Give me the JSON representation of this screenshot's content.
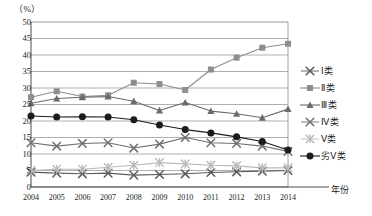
{
  "chart_data": {
    "type": "line",
    "title": "",
    "unit_label": "（%）",
    "xlabel": "年份",
    "ylabel": "",
    "grid": true,
    "legend_position": "right",
    "xlim": [
      2004,
      2014
    ],
    "ylim": [
      0,
      50
    ],
    "ytick_step": 5,
    "categories": [
      "2004",
      "2005",
      "2006",
      "2007",
      "2008",
      "2009",
      "2010",
      "2011",
      "2012",
      "2013",
      "2014"
    ],
    "yticks": [
      "50",
      "45",
      "40",
      "35",
      "30",
      "25",
      "20",
      "15",
      "10",
      "5",
      "0"
    ],
    "series": [
      {
        "name": "Ⅰ类",
        "marker": "x-cross",
        "color": "#5a5a5a",
        "values": [
          4.5,
          4.2,
          4.0,
          4.2,
          3.6,
          3.8,
          4.0,
          4.4,
          4.6,
          4.8,
          5.0
        ]
      },
      {
        "name": "Ⅱ类",
        "marker": "square",
        "color": "#8e8e8e",
        "values": [
          27.2,
          29.0,
          27.4,
          27.8,
          31.6,
          31.2,
          29.4,
          35.6,
          39.2,
          42.2,
          43.4
        ]
      },
      {
        "name": "Ⅲ类",
        "marker": "triangle",
        "color": "#6b6b6b",
        "values": [
          25.4,
          26.8,
          27.2,
          27.4,
          26.0,
          23.2,
          25.6,
          23.0,
          22.2,
          21.0,
          23.6
        ]
      },
      {
        "name": "Ⅳ类",
        "marker": "x-cross",
        "color": "#707070",
        "values": [
          13.4,
          12.4,
          13.2,
          13.4,
          11.8,
          13.0,
          15.0,
          13.4,
          13.2,
          12.4,
          10.8
        ]
      },
      {
        "name": "Ⅴ类",
        "marker": "asterisk",
        "color": "#b9b9b9",
        "values": [
          5.0,
          5.4,
          5.4,
          6.0,
          6.6,
          7.4,
          7.0,
          6.6,
          6.4,
          5.8,
          5.8
        ]
      },
      {
        "name": "劣Ⅴ类",
        "marker": "circle",
        "color": "#1c1c1c",
        "values": [
          21.5,
          21.2,
          21.3,
          21.2,
          20.4,
          18.8,
          17.4,
          16.4,
          15.2,
          13.8,
          11.2
        ]
      }
    ]
  },
  "legend": {
    "items": [
      {
        "label": "Ⅰ类"
      },
      {
        "label": "Ⅱ类"
      },
      {
        "label": "Ⅲ类"
      },
      {
        "label": "Ⅳ类"
      },
      {
        "label": "Ⅴ类"
      },
      {
        "label": "劣Ⅴ类"
      }
    ]
  }
}
